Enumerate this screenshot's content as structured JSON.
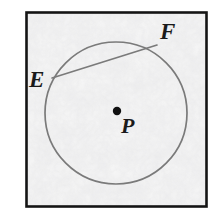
{
  "figure": {
    "type": "geometry-diagram",
    "frame": {
      "x": 26,
      "y": 12,
      "width": 181,
      "height": 195,
      "stroke_color": "#141414",
      "stroke_width": 2.5,
      "fill_color": "#f2f2f2"
    },
    "background_texture": {
      "name": "mottled-gray-paper",
      "base_color": "#f4f4f4",
      "speckle_color": "#d8d8d8"
    },
    "circle": {
      "center_x": 116,
      "center_y": 113,
      "radius": 71,
      "stroke_color": "#7a7a7a",
      "stroke_width": 1.7,
      "fill": "none"
    },
    "chord": {
      "name": "chord-EF",
      "x1": 52,
      "y1": 78,
      "x2": 157,
      "y2": 45,
      "stroke_color": "#7a7a7a",
      "stroke_width": 1.7
    },
    "center_point": {
      "name": "center-dot-P",
      "cx": 117,
      "cy": 111,
      "r": 4.2,
      "fill_color": "#111111"
    },
    "labels": {
      "E": "E",
      "F": "F",
      "P": "P"
    }
  }
}
